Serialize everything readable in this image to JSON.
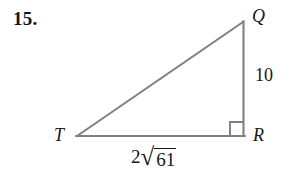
{
  "problem": {
    "number": "15."
  },
  "figure": {
    "type": "right-triangle",
    "stroke_color": "#808080",
    "stroke_width": 2,
    "background": "#ffffff",
    "vertices": [
      {
        "name": "T",
        "label": "T",
        "x": 77,
        "y": 136
      },
      {
        "name": "R",
        "label": "R",
        "x": 244,
        "y": 136
      },
      {
        "name": "Q",
        "label": "Q",
        "x": 243,
        "y": 22
      }
    ],
    "right_angle_at": "R",
    "right_angle_marker": {
      "size": 14,
      "x": 230,
      "y": 122
    },
    "sides": [
      {
        "name": "QR",
        "label": "10",
        "value": "10",
        "position": "right"
      },
      {
        "name": "TR",
        "label": "2√61",
        "coefficient": "2",
        "radical": "61",
        "position": "bottom"
      },
      {
        "name": "TQ",
        "label": "",
        "value": "",
        "position": "hypotenuse"
      }
    ]
  },
  "labels": {
    "vertex_q": "Q",
    "vertex_r": "R",
    "vertex_t": "T",
    "side_qr": "10",
    "side_tr_coefficient": "2",
    "side_tr_radical_symbol": "√",
    "side_tr_radicand": "61"
  }
}
